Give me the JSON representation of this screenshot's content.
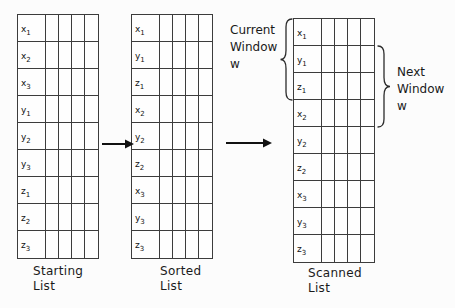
{
  "diagram": {
    "colors": {
      "background": "#fcfcfc",
      "grid_line": "#3c3c3c",
      "ink": "#1a1a1a"
    },
    "tables": [
      {
        "name": "starting-list",
        "caption_lines": [
          "Starting",
          "List"
        ],
        "columns": 5,
        "rows": [
          {
            "base": "x",
            "sub": "1"
          },
          {
            "base": "x",
            "sub": "2"
          },
          {
            "base": "x",
            "sub": "3"
          },
          {
            "base": "y",
            "sub": "1"
          },
          {
            "base": "y",
            "sub": "2"
          },
          {
            "base": "y",
            "sub": "3"
          },
          {
            "base": "z",
            "sub": "1"
          },
          {
            "base": "z",
            "sub": "2"
          },
          {
            "base": "z",
            "sub": "3"
          }
        ]
      },
      {
        "name": "sorted-list",
        "caption_lines": [
          "Sorted",
          "List"
        ],
        "columns": 5,
        "rows": [
          {
            "base": "x",
            "sub": "1"
          },
          {
            "base": "y",
            "sub": "1"
          },
          {
            "base": "z",
            "sub": "1"
          },
          {
            "base": "x",
            "sub": "2"
          },
          {
            "base": "y",
            "sub": "2"
          },
          {
            "base": "z",
            "sub": "2"
          },
          {
            "base": "x",
            "sub": "3"
          },
          {
            "base": "y",
            "sub": "3"
          },
          {
            "base": "z",
            "sub": "3"
          }
        ]
      },
      {
        "name": "scanned-list",
        "caption_lines": [
          "Scanned",
          "List"
        ],
        "columns": 5,
        "rows": [
          {
            "base": "x",
            "sub": "1"
          },
          {
            "base": "y",
            "sub": "1"
          },
          {
            "base": "z",
            "sub": "1"
          },
          {
            "base": "x",
            "sub": "2"
          },
          {
            "base": "y",
            "sub": "2"
          },
          {
            "base": "z",
            "sub": "2"
          },
          {
            "base": "x",
            "sub": "3"
          },
          {
            "base": "y",
            "sub": "3"
          },
          {
            "base": "z",
            "sub": "3"
          }
        ]
      }
    ],
    "annotations": {
      "current_window": {
        "lines": [
          "Current",
          "Window",
          "w"
        ],
        "target_rows": [
          "x1",
          "y1",
          "z1"
        ]
      },
      "next_window": {
        "lines": [
          "Next",
          "Window",
          "w"
        ],
        "target_rows": [
          "y1",
          "z1",
          "x2"
        ]
      }
    }
  }
}
